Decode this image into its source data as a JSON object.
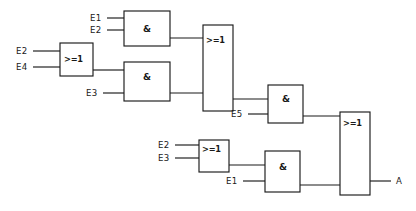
{
  "diagram": {
    "type": "logic-gate-schematic",
    "notation": "IEC rectangular (DIN 40700)",
    "output_signal": "A",
    "line_color": "#1a1a1a",
    "background_color": "#ffffff",
    "gate_symbols": {
      "and": "&",
      "or": ">=1"
    },
    "gates": [
      {
        "id": "or1",
        "symbol": ">=1",
        "function": "OR",
        "inputs": [
          "E2",
          "E4"
        ],
        "feeds": "and2",
        "box": {
          "x": 60,
          "y": 43,
          "w": 33,
          "h": 33
        }
      },
      {
        "id": "and1",
        "symbol": "&",
        "function": "AND",
        "inputs": [
          "E1",
          "E2"
        ],
        "feeds": "or2",
        "box": {
          "x": 124,
          "y": 11,
          "w": 46,
          "h": 35
        }
      },
      {
        "id": "and2",
        "symbol": "&",
        "function": "AND",
        "inputs": [
          "or1",
          "E3"
        ],
        "feeds": "or2",
        "box": {
          "x": 124,
          "y": 62,
          "w": 46,
          "h": 39
        }
      },
      {
        "id": "or2",
        "symbol": ">=1",
        "function": "OR",
        "inputs": [
          "and1",
          "and2"
        ],
        "feeds": "and3",
        "box": {
          "x": 203,
          "y": 25,
          "w": 30,
          "h": 86
        }
      },
      {
        "id": "and3",
        "symbol": "&",
        "function": "AND",
        "inputs": [
          "or2",
          "E5"
        ],
        "feeds": "or4",
        "box": {
          "x": 268,
          "y": 85,
          "w": 35,
          "h": 38
        }
      },
      {
        "id": "or3",
        "symbol": ">=1",
        "function": "OR",
        "inputs": [
          "E2",
          "E3"
        ],
        "feeds": "and4",
        "box": {
          "x": 199,
          "y": 140,
          "w": 30,
          "h": 32
        }
      },
      {
        "id": "and4",
        "symbol": "&",
        "function": "AND",
        "inputs": [
          "or3",
          "E1"
        ],
        "feeds": "or4",
        "box": {
          "x": 265,
          "y": 151,
          "w": 35,
          "h": 41
        }
      },
      {
        "id": "or4",
        "symbol": ">=1",
        "function": "OR",
        "inputs": [
          "and3",
          "and4"
        ],
        "feeds": "output-A",
        "box": {
          "x": 340,
          "y": 112,
          "w": 30,
          "h": 83
        }
      }
    ],
    "input_labels": [
      {
        "name": "E1",
        "text": "E1",
        "x": 90,
        "y": 21,
        "target": "and1"
      },
      {
        "name": "E2",
        "text": "E2",
        "x": 90,
        "y": 33,
        "target": "and1"
      },
      {
        "name": "E2",
        "text": "E2",
        "x": 16,
        "y": 54,
        "target": "or1"
      },
      {
        "name": "E4",
        "text": "E4",
        "x": 16,
        "y": 70,
        "target": "or1"
      },
      {
        "name": "E3",
        "text": "E3",
        "x": 86,
        "y": 96,
        "target": "and2"
      },
      {
        "name": "E5",
        "text": "E5",
        "x": 231,
        "y": 117,
        "target": "and3"
      },
      {
        "name": "E2",
        "text": "E2",
        "x": 158,
        "y": 148,
        "target": "or3"
      },
      {
        "name": "E3",
        "text": "E3",
        "x": 158,
        "y": 161,
        "target": "or3"
      },
      {
        "name": "E1",
        "text": "E1",
        "x": 226,
        "y": 184,
        "target": "and4"
      }
    ],
    "output_labels": [
      {
        "name": "A",
        "text": "A",
        "x": 396,
        "y": 184,
        "source": "or4"
      }
    ],
    "boolean_expression": "A = (E1 & E2 | (E2 | E4) & E3) & E5 | (E2 | E3) & E1"
  }
}
